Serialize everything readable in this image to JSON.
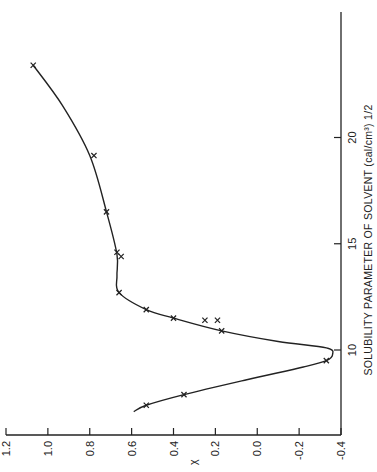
{
  "chart_data": {
    "type": "scatter",
    "orientation": "rotated 90deg counter-clockwise (x-axis vertical on right, y-axis horizontal at bottom)",
    "title": "",
    "xlabel": "SOLUBILITY PARAMETER OF SOLVENT (cal/cm³)^1/2",
    "ylabel": "χ",
    "xlim": [
      6,
      26
    ],
    "ylim": [
      -0.4,
      1.2
    ],
    "x_ticks": [
      "10",
      "15",
      "20"
    ],
    "y_ticks": [
      "1.2",
      "1.0",
      "0.8",
      "0.6",
      "0.4",
      "0.2",
      "0.0",
      "-0.2",
      "-0.4"
    ],
    "grid": false,
    "legend": null,
    "series": [
      {
        "name": "measured",
        "marker": "x",
        "points": [
          {
            "x": 7.4,
            "y": 0.53
          },
          {
            "x": 7.9,
            "y": 0.35
          },
          {
            "x": 9.5,
            "y": -0.33
          },
          {
            "x": 10.9,
            "y": 0.17
          },
          {
            "x": 11.4,
            "y": 0.25
          },
          {
            "x": 11.4,
            "y": 0.19
          },
          {
            "x": 11.5,
            "y": 0.4
          },
          {
            "x": 11.9,
            "y": 0.53
          },
          {
            "x": 12.7,
            "y": 0.66
          },
          {
            "x": 14.4,
            "y": 0.65
          },
          {
            "x": 14.6,
            "y": 0.67
          },
          {
            "x": 16.5,
            "y": 0.72
          },
          {
            "x": 19.15,
            "y": 0.78
          },
          {
            "x": 23.4,
            "y": 1.07
          }
        ]
      },
      {
        "name": "fitted curve",
        "type": "line",
        "points": [
          {
            "x": 7.1,
            "y": 0.59
          },
          {
            "x": 7.4,
            "y": 0.53
          },
          {
            "x": 7.9,
            "y": 0.35
          },
          {
            "x": 8.6,
            "y": 0.05
          },
          {
            "x": 9.2,
            "y": -0.22
          },
          {
            "x": 9.5,
            "y": -0.33
          },
          {
            "x": 9.8,
            "y": -0.36
          },
          {
            "x": 10.1,
            "y": -0.33
          },
          {
            "x": 10.4,
            "y": -0.1
          },
          {
            "x": 10.9,
            "y": 0.17
          },
          {
            "x": 11.5,
            "y": 0.4
          },
          {
            "x": 11.9,
            "y": 0.53
          },
          {
            "x": 12.7,
            "y": 0.66
          },
          {
            "x": 13.5,
            "y": 0.67
          },
          {
            "x": 14.5,
            "y": 0.67
          },
          {
            "x": 16.5,
            "y": 0.72
          },
          {
            "x": 19.15,
            "y": 0.8
          },
          {
            "x": 21.5,
            "y": 0.93
          },
          {
            "x": 23.4,
            "y": 1.07
          }
        ]
      }
    ]
  }
}
